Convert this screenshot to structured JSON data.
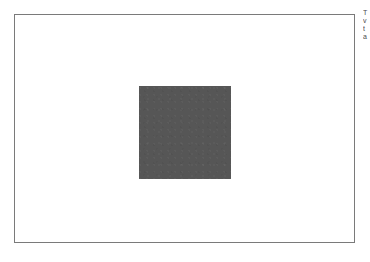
{
  "page": {
    "background_color": "#ffffff",
    "width": 370,
    "height": 262
  },
  "canvas": {
    "name": "figure-canvas",
    "background_color": "#ffffff",
    "border_color": "#7a7a7a",
    "border_width_px": 1,
    "left": 14,
    "top": 14,
    "width": 341,
    "height": 229
  },
  "shape": {
    "name": "gray-square",
    "type": "square",
    "fill_color": "#565656",
    "left": 138,
    "top": 85,
    "width": 92,
    "height": 93
  },
  "margin_note": {
    "clipped": true,
    "lines": [
      "T",
      "v",
      "t",
      "a"
    ]
  }
}
